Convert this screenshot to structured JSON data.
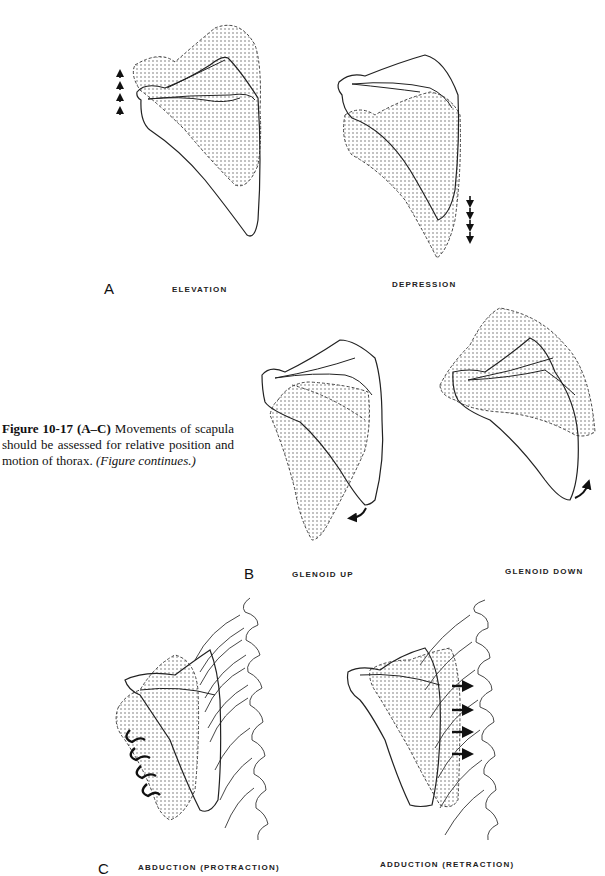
{
  "figure": {
    "number": "Figure 10-17",
    "panels_ref": "(A–C)",
    "caption_text": " Movements of scapula should be assessed for relative position and motion of thorax.",
    "caption_note": " (Figure continues.)"
  },
  "panels": {
    "A": {
      "letter": "A",
      "left_label": "ELEVATION",
      "right_label": "DEPRESSION",
      "left_icon": "up-arrows-icon",
      "right_icon": "down-arrows-icon"
    },
    "B": {
      "letter": "B",
      "left_label": "GLENOID UP",
      "right_label": "GLENOID DOWN",
      "left_icon": "curved-arrow-down-icon",
      "right_icon": "curved-arrow-up-icon"
    },
    "C": {
      "letter": "C",
      "left_label": "ABDUCTION (PROTRACTION)",
      "right_label": "ADDUCTION (RETRACTION)",
      "left_icon": "wavy-arrows-left-icon",
      "right_icon": "right-arrows-icon"
    }
  },
  "colors": {
    "ink": "#222222",
    "stipple": "#555555",
    "background": "#ffffff"
  }
}
